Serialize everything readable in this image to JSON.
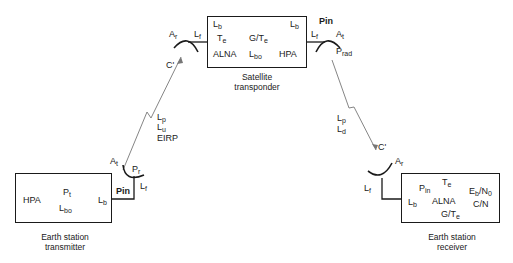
{
  "satellite": {
    "caption_line1": "Satellite",
    "caption_line2": "transponder",
    "labels": {
      "lb_left": "L",
      "lb_left_sub": "b",
      "lb_right": "L",
      "lb_right_sub": "b",
      "te": "T",
      "te_sub": "e",
      "gte": "G/T",
      "gte_sub": "e",
      "alna": "ALNA",
      "lbo": "L",
      "lbo_sub": "bo",
      "hpa": "HPA"
    },
    "rx_antenna": {
      "ar": "A",
      "ar_sub": "r",
      "lf": "L",
      "lf_sub": "f",
      "c_prime": "C'"
    },
    "tx_antenna": {
      "pin": "Pin",
      "at": "A",
      "at_sub": "t",
      "lf": "L",
      "lf_sub": "f",
      "prad": "P",
      "prad_sub": "rad"
    }
  },
  "uplink": {
    "lp": "L",
    "lp_sub": "p",
    "lu": "L",
    "lu_sub": "u",
    "eirp": "EIRP"
  },
  "downlink": {
    "lp": "L",
    "lp_sub": "p",
    "ld": "L",
    "ld_sub": "d",
    "c_prime": "C'"
  },
  "earth_tx": {
    "caption_line1": "Earth station",
    "caption_line2": "transmitter",
    "labels": {
      "hpa": "HPA",
      "pt": "P",
      "pt_sub": "t",
      "lbo": "L",
      "lbo_sub": "bo",
      "lb": "L",
      "lb_sub": "b",
      "pin": "Pin"
    },
    "antenna": {
      "at": "A",
      "at_sub": "t",
      "pr": "P",
      "pr_sub": "r",
      "lf": "L",
      "lf_sub": "f"
    }
  },
  "earth_rx": {
    "caption_line1": "Earth station",
    "caption_line2": "receiver",
    "labels": {
      "pin": "P",
      "pin_sub": "in",
      "te": "T",
      "te_sub": "e",
      "ebn0": "E",
      "ebn0_sub1": "b",
      "ebn0_mid": "/N",
      "ebn0_sub2": "0",
      "lb": "L",
      "lb_sub": "b",
      "alna": "ALNA",
      "cn": "C/N",
      "gte": "G/T",
      "gte_sub": "e"
    },
    "antenna": {
      "ar": "A",
      "ar_sub": "r",
      "lf": "L",
      "lf_sub": "f"
    }
  }
}
